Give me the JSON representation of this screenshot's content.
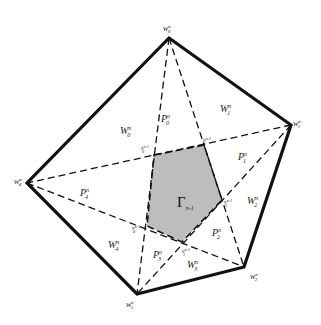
{
  "diagram": {
    "colors": {
      "outline": "#111111",
      "dashed": "#111111",
      "shaded": "#bdbdbd",
      "background": "#ffffff"
    },
    "outer_vertices": [
      {
        "id": "w0",
        "base": "w",
        "sup": "n",
        "sub": "0",
        "x": 169,
        "y": 38
      },
      {
        "id": "w1",
        "base": "w",
        "sup": "n",
        "sub": "1",
        "x": 291,
        "y": 125
      },
      {
        "id": "w2",
        "base": "w",
        "sup": "n",
        "sub": "2",
        "x": 244,
        "y": 267
      },
      {
        "id": "w3",
        "base": "w",
        "sup": "n",
        "sub": "3",
        "x": 137,
        "y": 294
      },
      {
        "id": "w4",
        "base": "w",
        "sup": "n",
        "sub": "4",
        "x": 27,
        "y": 183
      }
    ],
    "inner_vertices": [
      {
        "id": "v0",
        "base": "v",
        "sup": "n-1",
        "sub": "0",
        "x": 154,
        "y": 155
      },
      {
        "id": "v1",
        "base": "v",
        "sup": "n-1",
        "sub": "1",
        "x": 204,
        "y": 145
      },
      {
        "id": "v2",
        "base": "v",
        "sup": "n-1",
        "sub": "2",
        "x": 222,
        "y": 200
      },
      {
        "id": "v3",
        "base": "v",
        "sup": "n-1",
        "sub": "3",
        "x": 182,
        "y": 242
      },
      {
        "id": "v4",
        "base": "v",
        "sup": "n-1",
        "sub": "4",
        "x": 147,
        "y": 226
      }
    ],
    "center_label": {
      "base": "Γ",
      "sub": "n-1"
    },
    "region_labels": {
      "W0": {
        "base": "W",
        "sup": "n",
        "sub": "0"
      },
      "W1": {
        "base": "W",
        "sup": "n",
        "sub": "1"
      },
      "W2": {
        "base": "W",
        "sup": "n",
        "sub": "2"
      },
      "W3": {
        "base": "W",
        "sup": "n",
        "sub": "3"
      },
      "W4": {
        "base": "W",
        "sup": "n",
        "sub": "4"
      },
      "P0": {
        "base": "P",
        "sup": "n",
        "sub": "0"
      },
      "P1": {
        "base": "P",
        "sup": "n",
        "sub": "1"
      },
      "P2": {
        "base": "P",
        "sup": "n",
        "sub": "2"
      },
      "P3": {
        "base": "P",
        "sup": "n",
        "sub": "3"
      },
      "P4": {
        "base": "P",
        "sup": "n",
        "sub": "4"
      }
    }
  }
}
